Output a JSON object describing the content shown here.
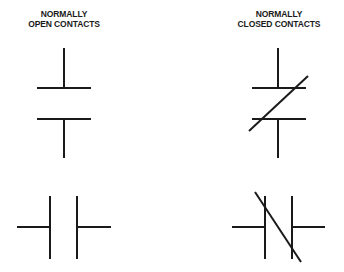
{
  "diagram": {
    "columns": [
      {
        "id": "normally-open",
        "title_line1": "NORMALLY",
        "title_line2": "OPEN CONTACTS"
      },
      {
        "id": "normally-closed",
        "title_line1": "NORMALLY",
        "title_line2": "CLOSED CONTACTS"
      }
    ],
    "symbols": [
      {
        "name": "normally-open-contact-vertical",
        "orientation": "vertical",
        "state": "open"
      },
      {
        "name": "normally-closed-contact-vertical",
        "orientation": "vertical",
        "state": "closed",
        "slash": true
      },
      {
        "name": "normally-open-contact-horizontal",
        "orientation": "horizontal",
        "state": "open"
      },
      {
        "name": "normally-closed-contact-horizontal",
        "orientation": "horizontal",
        "state": "closed",
        "slash": true
      }
    ],
    "stroke_color": "#1a1a1a",
    "background_color": "#ffffff"
  }
}
